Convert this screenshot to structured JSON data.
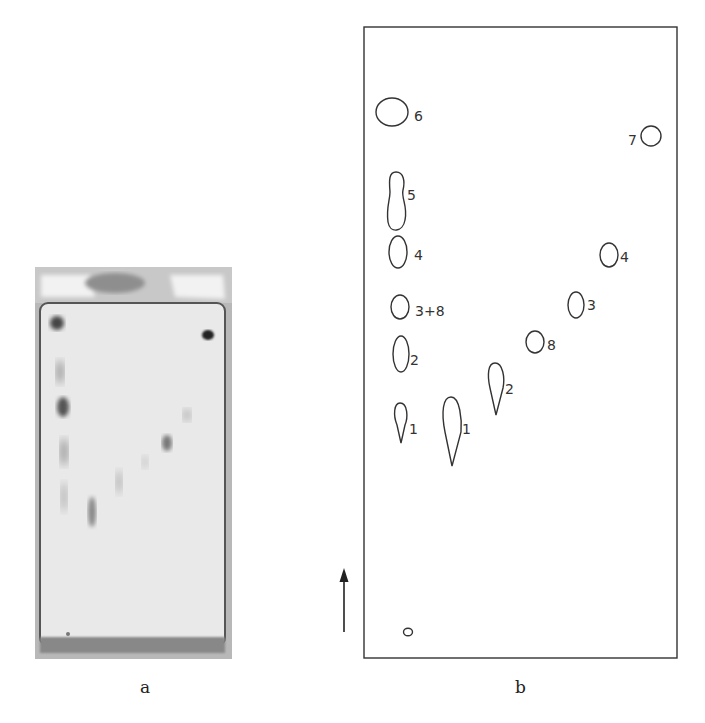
{
  "panels": {
    "a": {
      "caption": "a",
      "description": "photograph of developed TLC plate"
    },
    "b": {
      "caption": "b",
      "description": "schematic tracing of TLC plate spots",
      "origin_label": "o",
      "direction": "arrow-up-icon",
      "spot_labels": {
        "s6": "6",
        "s5": "5",
        "s4_left": "4",
        "s38": "3+8",
        "s2_left": "2",
        "s1_left": "1",
        "s1_mid": "1",
        "s2_mid": "2",
        "s8": "8",
        "s3_right": "3",
        "s4_right": "4",
        "s7": "7"
      }
    }
  },
  "colors": {
    "line": "#333333",
    "plate_bg": "#d9d9d9",
    "plate_frame": "#8a8a8a"
  }
}
